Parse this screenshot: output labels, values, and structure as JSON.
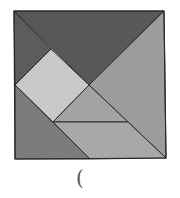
{
  "diagram": {
    "type": "tangram-square",
    "stroke": "#2a2a2a",
    "pieces": [
      {
        "name": "top-large-triangle",
        "points": "14,11 164,11 89,85",
        "fill": "#585858"
      },
      {
        "name": "left-small-triangle",
        "points": "14,11 51,49 15,85",
        "fill": "#5c5c5c"
      },
      {
        "name": "light-square",
        "points": "51,49 89,85 53,122 15,85",
        "fill": "#c9c9c9"
      },
      {
        "name": "right-large-triangle",
        "points": "164,11 166,158 89,85",
        "fill": "#9c9c9c"
      },
      {
        "name": "middle-small-triangle",
        "points": "89,85 53,122 128,122",
        "fill": "#a3a3a3"
      },
      {
        "name": "parallelogram",
        "points": "53,122 128,122 166,158 90,159",
        "fill": "#a8a8a8"
      },
      {
        "name": "bottom-left-medium-triangle",
        "points": "15,85 15,159 90,159",
        "fill": "#7c7c7c"
      }
    ],
    "outline": "14,11 164,11 166,158 15,159"
  },
  "caption": {
    "text": "("
  }
}
